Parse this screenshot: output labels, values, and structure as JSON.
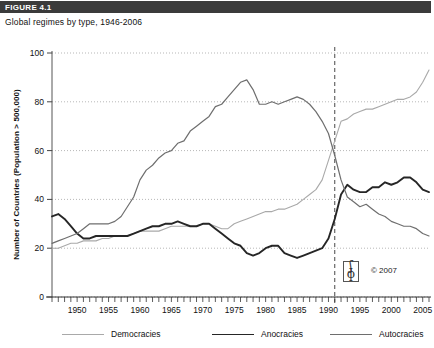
{
  "figure": {
    "tag": "FIGURE 4.1",
    "subtitle": "Global regimes by type, 1946-2006"
  },
  "credit": {
    "copyright": "© 2007",
    "logo_upper": "ʃ",
    "logo_lower": "ɸ"
  },
  "legend": [
    {
      "label": "Democracies",
      "color": "#a9a9a9",
      "width": 1.1
    },
    {
      "label": "Anocracies",
      "color": "#262626",
      "width": 1.9
    },
    {
      "label": "Autocracies",
      "color": "#6e6e6e",
      "width": 1.2
    }
  ],
  "chart_data": {
    "type": "line",
    "title": "Global regimes by type, 1946-2006",
    "xlabel": "",
    "ylabel": "Number of Countries (Population > 500,000)",
    "xlim": [
      1946,
      2006
    ],
    "ylim": [
      0,
      100
    ],
    "grid": true,
    "legend_position": "bottom",
    "yticks": [
      0,
      20,
      40,
      60,
      80,
      100
    ],
    "xticks_major": [
      1950,
      1955,
      1960,
      1965,
      1970,
      1975,
      1980,
      1985,
      1990,
      1995,
      2000,
      2005
    ],
    "xticks_minor_step": 1,
    "annotations": [
      {
        "type": "vline",
        "x": 1991,
        "style": "dashed",
        "color": "#333333"
      }
    ],
    "x": [
      1946,
      1947,
      1948,
      1949,
      1950,
      1951,
      1952,
      1953,
      1954,
      1955,
      1956,
      1957,
      1958,
      1959,
      1960,
      1961,
      1962,
      1963,
      1964,
      1965,
      1966,
      1967,
      1968,
      1969,
      1970,
      1971,
      1972,
      1973,
      1974,
      1975,
      1976,
      1977,
      1978,
      1979,
      1980,
      1981,
      1982,
      1983,
      1984,
      1985,
      1986,
      1987,
      1988,
      1989,
      1990,
      1991,
      1992,
      1993,
      1994,
      1995,
      1996,
      1997,
      1998,
      1999,
      2000,
      2001,
      2002,
      2003,
      2004,
      2005,
      2006
    ],
    "series": [
      {
        "name": "Democracies",
        "color": "#a9a9a9",
        "values": [
          20,
          20,
          21,
          22,
          22,
          23,
          23,
          23,
          24,
          24,
          25,
          25,
          25,
          26,
          27,
          27,
          27,
          27,
          28,
          29,
          29,
          29,
          29,
          29,
          30,
          30,
          29,
          28,
          28,
          30,
          31,
          32,
          33,
          34,
          35,
          35,
          36,
          36,
          37,
          38,
          40,
          42,
          44,
          48,
          56,
          64,
          72,
          73,
          75,
          76,
          77,
          77,
          78,
          79,
          80,
          81,
          81,
          82,
          84,
          88,
          93
        ]
      },
      {
        "name": "Anocracies",
        "color": "#262626",
        "values": [
          33,
          34,
          32,
          29,
          26,
          24,
          24,
          25,
          25,
          25,
          25,
          25,
          25,
          26,
          27,
          28,
          29,
          29,
          30,
          30,
          31,
          30,
          29,
          29,
          30,
          30,
          28,
          26,
          24,
          22,
          21,
          18,
          17,
          18,
          20,
          21,
          21,
          18,
          17,
          16,
          17,
          18,
          19,
          20,
          24,
          32,
          42,
          46,
          44,
          43,
          43,
          45,
          45,
          47,
          46,
          47,
          49,
          49,
          47,
          44,
          43
        ]
      },
      {
        "name": "Autocracies",
        "color": "#6e6e6e",
        "values": [
          22,
          23,
          24,
          25,
          26,
          28,
          30,
          30,
          30,
          30,
          31,
          33,
          37,
          41,
          48,
          52,
          54,
          57,
          59,
          60,
          63,
          64,
          68,
          70,
          72,
          74,
          78,
          79,
          82,
          85,
          88,
          89,
          85,
          79,
          79,
          80,
          79,
          80,
          81,
          82,
          81,
          79,
          76,
          72,
          67,
          58,
          48,
          41,
          39,
          37,
          38,
          36,
          34,
          33,
          31,
          30,
          29,
          29,
          28,
          26,
          25
        ]
      }
    ]
  }
}
